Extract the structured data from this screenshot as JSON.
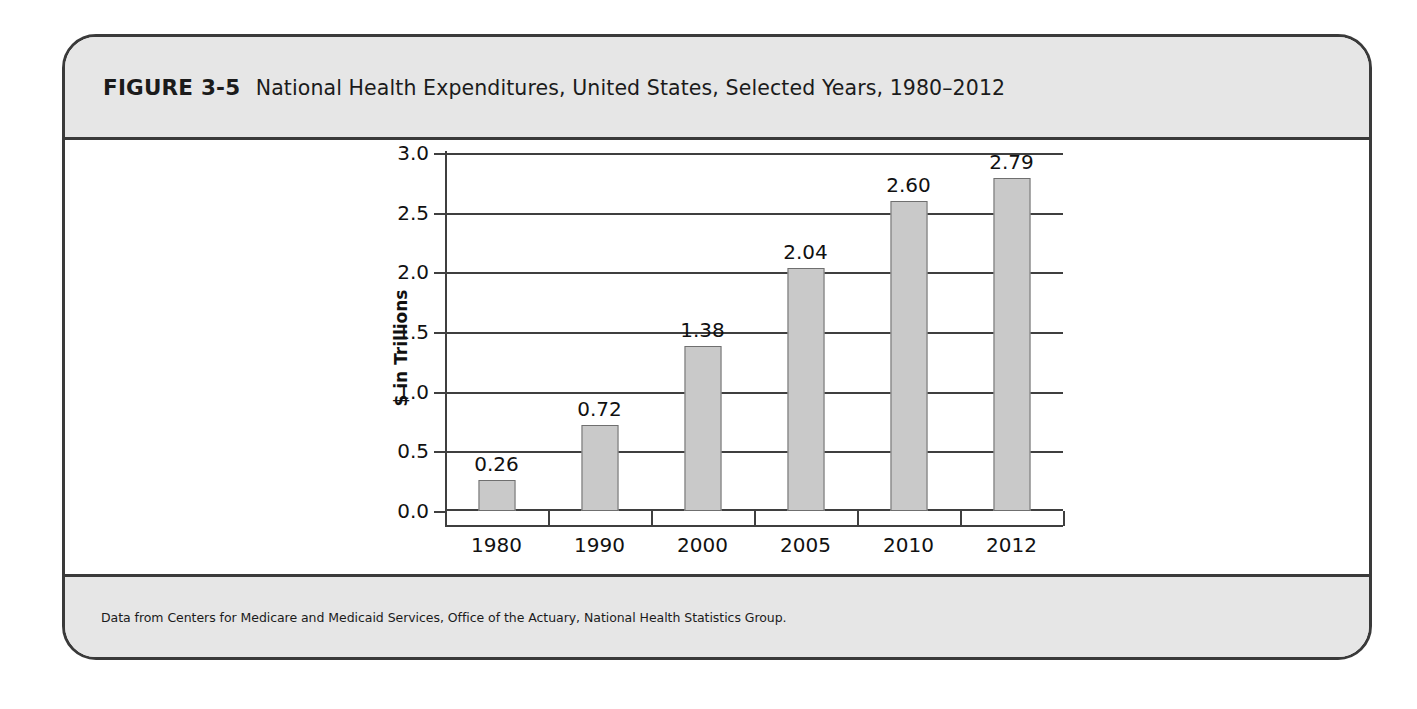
{
  "figure": {
    "number_label": "FIGURE 3-5",
    "title": "National Health Expenditures, United States, Selected Years, 1980–2012",
    "source_note": "Data from Centers for Medicare and Medicaid Services, Office of the Actuary, National Health Statistics Group.",
    "frame_color": "#3a3a3a",
    "band_color": "#e6e6e6"
  },
  "chart_data": {
    "type": "bar",
    "title": "National Health Expenditures, United States, Selected Years, 1980–2012",
    "categories": [
      "1980",
      "1990",
      "2000",
      "2005",
      "2010",
      "2012"
    ],
    "values": [
      0.26,
      0.72,
      1.38,
      2.04,
      2.6,
      2.79
    ],
    "data_labels": [
      "0.26",
      "0.72",
      "1.38",
      "2.04",
      "2.60",
      "2.79"
    ],
    "xlabel": "",
    "ylabel": "$ in Trillions",
    "ylim": [
      0.0,
      3.0
    ],
    "ytick_labels": [
      "0.0",
      "0.5",
      "1.0",
      "1.5",
      "2.0",
      "2.5",
      "3.0"
    ],
    "ytick_values": [
      0.0,
      0.5,
      1.0,
      1.5,
      2.0,
      2.5,
      3.0
    ],
    "grid": "horizontal",
    "legend": "none",
    "bar_color": "#c9c9c9",
    "bar_border_color": "#6f6f6f"
  }
}
